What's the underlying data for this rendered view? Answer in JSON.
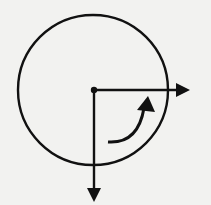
{
  "diagram": {
    "colors": {
      "background": "#f2f2f0",
      "stroke": "#111111"
    },
    "circle": {
      "cx": 93,
      "cy": 90,
      "r": 76
    },
    "center_point": {
      "x": 94,
      "y": 90
    },
    "arrows": [
      {
        "name": "horizontal-arrow",
        "from": [
          94,
          90
        ],
        "to": [
          189,
          90
        ]
      },
      {
        "name": "vertical-arrow",
        "from": [
          94,
          90
        ],
        "to": [
          94,
          202
        ]
      }
    ],
    "rotation_arrow": {
      "start": [
        108,
        143
      ],
      "end": [
        147,
        97
      ],
      "direction": "counterclockwise"
    }
  }
}
